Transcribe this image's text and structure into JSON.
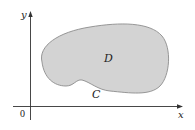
{
  "diagram": {
    "axes": {
      "x_label": "x",
      "y_label": "y",
      "origin_label": "0"
    },
    "region": {
      "label": "D",
      "fill": "#d3d3d3",
      "stroke": "#8c8c8c"
    },
    "boundary": {
      "label": "C"
    },
    "colors": {
      "axis": "#333333",
      "background": "#ffffff"
    }
  }
}
